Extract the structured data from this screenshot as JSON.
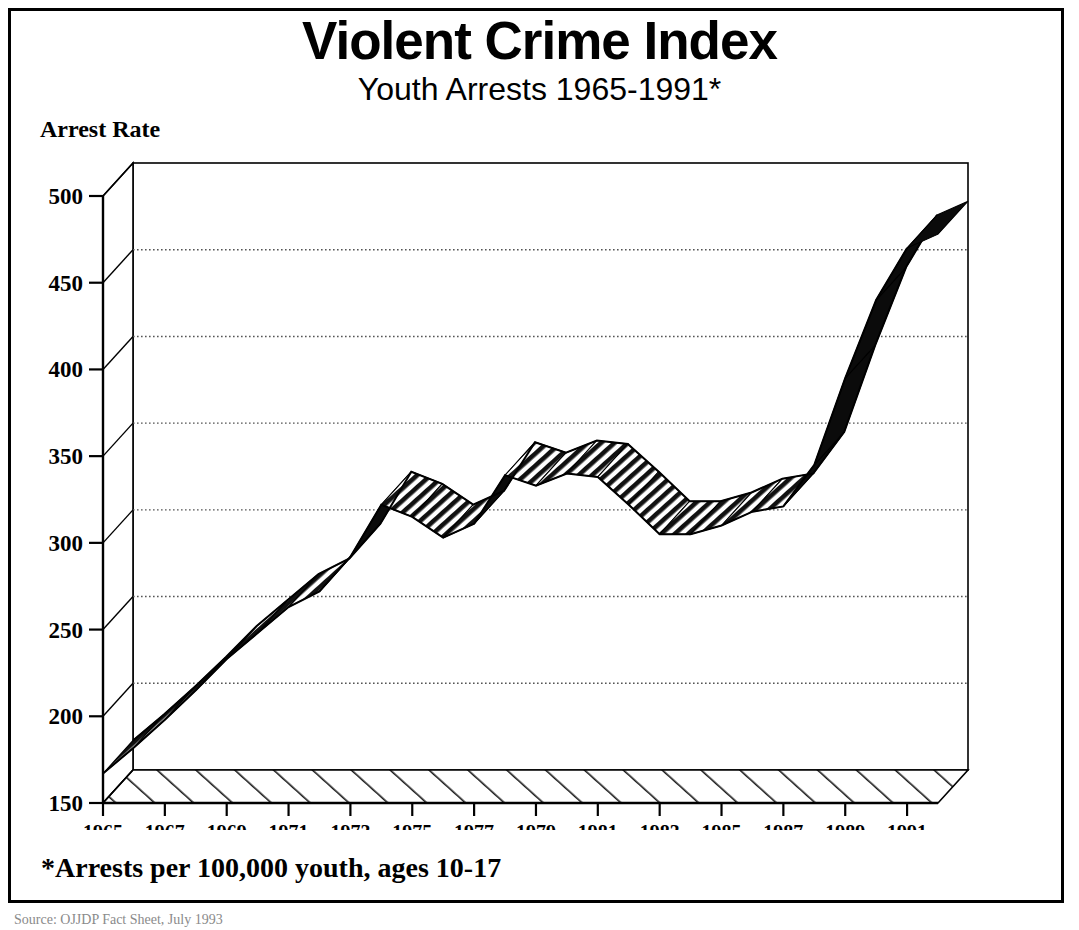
{
  "header": {
    "title": "Violent Crime Index",
    "subtitle": "Youth Arrests 1965-1991*",
    "y_axis_caption": "Arrest Rate"
  },
  "footnote": {
    "text": "*Arrests per 100,000 youth, ages 10-17"
  },
  "source": {
    "text": "Source: OJJDP Fact Sheet, July 1993"
  },
  "chart_data": {
    "type": "area",
    "title": "Violent Crime Index",
    "subtitle": "Youth Arrests 1965-1991*",
    "xlabel": "",
    "ylabel": "Arrest Rate",
    "ylim": [
      150,
      500
    ],
    "xlim": [
      1965,
      1992
    ],
    "ytick_labels": [
      "150",
      "200",
      "250",
      "300",
      "350",
      "400",
      "450",
      "500"
    ],
    "ytick_values": [
      150,
      200,
      250,
      300,
      350,
      400,
      450,
      500
    ],
    "xtick_labels": [
      "1965",
      "1967",
      "1969",
      "1971",
      "1973",
      "1975",
      "1977",
      "1979",
      "1981",
      "1983",
      "1985",
      "1987",
      "1989",
      "1991"
    ],
    "xtick_values": [
      1965,
      1967,
      1969,
      1971,
      1973,
      1975,
      1977,
      1979,
      1981,
      1983,
      1985,
      1987,
      1989,
      1991
    ],
    "grid": true,
    "grid_values": [
      200,
      250,
      300,
      350,
      400,
      450
    ],
    "legend": [],
    "style": "3d-ribbon-hatched",
    "x": [
      1965,
      1966,
      1967,
      1968,
      1969,
      1970,
      1971,
      1972,
      1973,
      1974,
      1975,
      1976,
      1977,
      1978,
      1979,
      1980,
      1981,
      1982,
      1983,
      1984,
      1985,
      1986,
      1987,
      1988,
      1989,
      1990,
      1991
    ],
    "values": [
      167,
      182,
      198,
      215,
      233,
      248,
      263,
      272,
      292,
      322,
      315,
      303,
      311,
      339,
      333,
      340,
      338,
      322,
      305,
      305,
      310,
      318,
      321,
      345,
      395,
      440,
      470
    ],
    "annotations": [
      {
        "label": "start 1965",
        "value": 167
      },
      {
        "label": "first peak 1974",
        "value": 322
      },
      {
        "label": "dip 1976",
        "value": 303
      },
      {
        "label": "plateau peak 1978-1981",
        "value": 340
      },
      {
        "label": "trough 1983-1984",
        "value": 305
      },
      {
        "label": "steep rise to 1991",
        "value": 470
      },
      {
        "label": "line end",
        "value": 478
      }
    ]
  },
  "geometry": {
    "plot_left": 133,
    "plot_right": 968,
    "plot_top": 163,
    "plot_bottom": 803,
    "depth_x": 30,
    "depth_y": 33,
    "units_per_pixel": 0.586
  }
}
